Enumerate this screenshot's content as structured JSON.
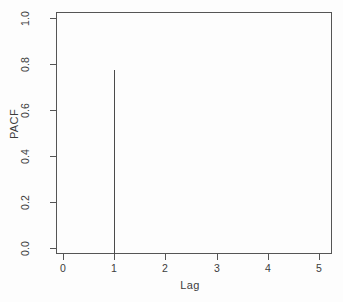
{
  "chart_data": {
    "type": "bar",
    "title": "",
    "subtitle": "",
    "xlabel": "Lag",
    "ylabel": "PACF",
    "x": [
      1
    ],
    "values": [
      0.8
    ],
    "categories": [
      "1"
    ],
    "series": [
      {
        "name": "PACF",
        "values": [
          0.8
        ]
      }
    ],
    "xlim": [
      -0.12,
      5.25
    ],
    "ylim": [
      0.0,
      1.05
    ],
    "xticks": [
      0,
      1,
      2,
      3,
      4,
      5
    ],
    "xticklabels": [
      "0",
      "1",
      "2",
      "3",
      "4",
      "5"
    ],
    "yticks": [
      0.0,
      0.2,
      0.4,
      0.6,
      0.8,
      1.0
    ],
    "yticklabels": [
      "0.0",
      "0.2",
      "0.4",
      "0.6",
      "0.8",
      "1.0"
    ],
    "grid": false,
    "legend": false,
    "style": "r-base-plot",
    "marker": "vertical-spike",
    "line_color": "#4a4a4a",
    "axis_color": "#555555",
    "background_color": "#fdfdfd",
    "annotations": []
  },
  "axis": {
    "y_title": "PACF",
    "x_title": "Lag",
    "y_ticklabels": [
      "0.0",
      "0.2",
      "0.4",
      "0.6",
      "0.8",
      "1.0"
    ],
    "x_ticklabels": [
      "0",
      "1",
      "2",
      "3",
      "4",
      "5"
    ]
  }
}
